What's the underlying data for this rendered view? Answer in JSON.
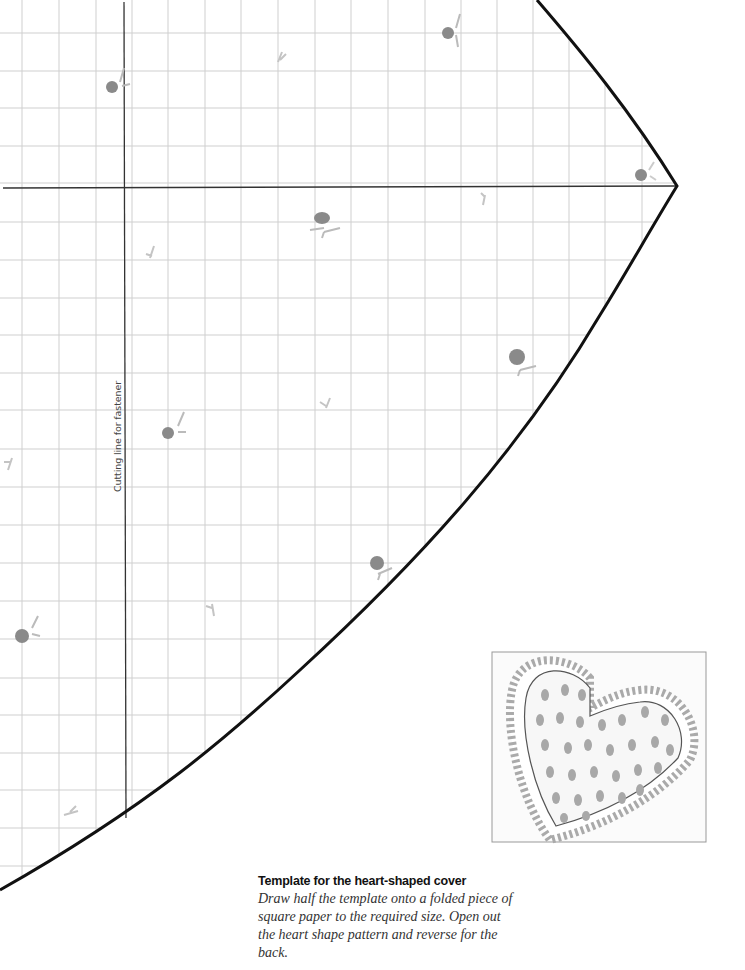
{
  "template": {
    "cutting_line_label": "Cutting line for fastener",
    "outline_color": "#111111",
    "grid_color": "#cfcfcf",
    "axis_color": "#333333",
    "decoration_color": "#8a8a8a"
  },
  "caption": {
    "title": "Template for the heart-shaped cover",
    "body": "Draw half the template onto a folded piece of square paper to the required size. Open out the heart shape pattern and reverse for the back."
  },
  "illustration": {
    "subject": "heart-shaped lace-trimmed cushion cover"
  }
}
